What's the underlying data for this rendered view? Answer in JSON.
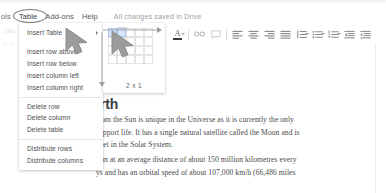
{
  "app": {
    "name": "Google Docs",
    "save_status": "All changes saved in Drive"
  },
  "menubar": {
    "items": [
      {
        "label": "ols",
        "name": "menu-tools-clipped",
        "highlighted": false
      },
      {
        "label": "Table",
        "name": "menu-table",
        "highlighted": true
      },
      {
        "label": "Add-ons",
        "name": "menu-addons",
        "highlighted": false
      },
      {
        "label": "Help",
        "name": "menu-help",
        "highlighted": false
      }
    ]
  },
  "toolbar": {
    "items": [
      {
        "icon": "italic-icon",
        "label": "I"
      },
      {
        "icon": "underline-icon",
        "label": "U"
      },
      {
        "icon": "text-color-icon",
        "label": "A"
      },
      {
        "icon": "insert-link-icon",
        "label": "∞"
      },
      {
        "icon": "add-comment-icon",
        "label": ""
      },
      {
        "icon": "align-left-icon",
        "label": ""
      },
      {
        "icon": "align-center-icon",
        "label": ""
      },
      {
        "icon": "align-right-icon",
        "label": ""
      },
      {
        "icon": "align-justify-icon",
        "label": ""
      },
      {
        "icon": "line-spacing-icon",
        "label": ""
      },
      {
        "icon": "bulleted-list-icon",
        "label": ""
      },
      {
        "icon": "numbered-list-icon",
        "label": ""
      },
      {
        "icon": "decrease-indent-icon",
        "label": ""
      },
      {
        "icon": "increase-indent-icon",
        "label": ""
      }
    ]
  },
  "table_menu": {
    "items": [
      {
        "label": "Insert Table",
        "has_submenu": true
      },
      {
        "label": "Insert row above",
        "has_submenu": false
      },
      {
        "label": "Insert row below",
        "has_submenu": false
      },
      {
        "label": "Insert column left",
        "has_submenu": false
      },
      {
        "label": "Insert column right",
        "has_submenu": false
      },
      {
        "label": "Delete row",
        "has_submenu": false
      },
      {
        "label": "Delete column",
        "has_submenu": false
      },
      {
        "label": "Delete table",
        "has_submenu": false
      },
      {
        "label": "Distribute rows",
        "has_submenu": false
      },
      {
        "label": "Distribute columns",
        "has_submenu": false
      }
    ]
  },
  "table_size_picker": {
    "size_label": "2 x 1",
    "columns": 2,
    "rows": 1,
    "grid_cols": 5,
    "grid_rows": 4
  },
  "document": {
    "heading": "rth",
    "heading_full": "Earth",
    "paragraph1": "from the Sun is unique in the Universe as it is currently the only\nsupport life. It has a single natural satellite called the Moon and is\nanet in the Solar System.",
    "paragraph2": "Sun at an average distance of about 150 million kilometres every\nys and has an orbital speed of about 107,000 km/h (66,486 miles"
  },
  "colors": {
    "menu_text": "#58595b",
    "status_text": "#9aa0a6",
    "body_text": "#4a4a4a",
    "heading_text": "#3d3d3d",
    "selection_blue": "#d7e6fb",
    "cursor_gray": "#9e9e9e"
  }
}
